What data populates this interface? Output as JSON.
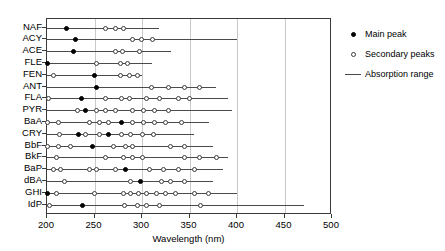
{
  "chart_data": {
    "type": "scatter",
    "title": "",
    "xlabel": "Wavelength (nm)",
    "ylabel": "",
    "xlim": [
      200,
      500
    ],
    "xticks": [
      200,
      250,
      300,
      350,
      400,
      450,
      500
    ],
    "xtick_labels": [
      "200",
      "250",
      "300",
      "350",
      "400",
      "450",
      "500"
    ],
    "grid": true,
    "grid_axis": "x",
    "legend_position": "right",
    "legend": [
      {
        "label": "Main peak",
        "marker": "filled-circle"
      },
      {
        "label": "Secondary peaks",
        "marker": "open-circle"
      },
      {
        "label": "Absorption range",
        "marker": "line"
      }
    ],
    "categories": [
      "NAF",
      "ACY",
      "ACE",
      "FLE",
      "FEN",
      "ANT",
      "FLA",
      "PYR",
      "BaA",
      "CRY",
      "BbF",
      "BkF",
      "BaP",
      "dBA",
      "GHI",
      "IdP"
    ],
    "rows": [
      {
        "category": "NAF",
        "range": [
          200,
          318
        ],
        "main": [
          221
        ],
        "secondary": [
          262,
          272,
          281
        ]
      },
      {
        "category": "ACY",
        "range": [
          200,
          400
        ],
        "main": [
          230
        ],
        "secondary": [
          290,
          299,
          311
        ]
      },
      {
        "category": "ACE",
        "range": [
          200,
          330
        ],
        "main": [
          228
        ],
        "secondary": [
          272,
          279,
          297
        ]
      },
      {
        "category": "FLE",
        "range": [
          200,
          310
        ],
        "main": [
          200
        ],
        "secondary": [
          252,
          277,
          285
        ]
      },
      {
        "category": "FEN",
        "range": [
          200,
          300
        ],
        "main": [
          250
        ],
        "secondary": [
          207,
          277,
          287,
          295
        ]
      },
      {
        "category": "ANT",
        "range": [
          200,
          378
        ],
        "main": [
          252
        ],
        "secondary": [
          310,
          328,
          345,
          360
        ]
      },
      {
        "category": "FLA",
        "range": [
          200,
          390
        ],
        "main": [
          236
        ],
        "secondary": [
          202,
          262,
          278,
          287,
          305,
          318,
          338,
          350
        ]
      },
      {
        "category": "PYR",
        "range": [
          200,
          395
        ],
        "main": [
          240
        ],
        "secondary": [
          232,
          252,
          262,
          272,
          290,
          302,
          313,
          328
        ]
      },
      {
        "category": "BaA",
        "range": [
          200,
          370
        ],
        "main": [
          278
        ],
        "secondary": [
          200,
          212,
          245,
          255,
          265,
          290,
          302,
          313,
          325,
          342
        ]
      },
      {
        "category": "CRY",
        "range": [
          200,
          355
        ],
        "main": [
          233,
          265
        ],
        "secondary": [
          213,
          240,
          255,
          278,
          288,
          300,
          312
        ]
      },
      {
        "category": "BbF",
        "range": [
          200,
          375
        ],
        "main": [
          248
        ],
        "secondary": [
          200,
          212,
          225,
          270,
          283,
          290,
          330,
          345
        ]
      },
      {
        "category": "BkF",
        "range": [
          200,
          390
        ],
        "main": [],
        "secondary": [
          210,
          262,
          280,
          290,
          300,
          345,
          360,
          378
        ]
      },
      {
        "category": "BaP",
        "range": [
          200,
          385
        ],
        "main": [
          283
        ],
        "secondary": [
          207,
          214,
          245,
          252,
          272,
          308,
          323,
          338,
          355
        ]
      },
      {
        "category": "dBA",
        "range": [
          200,
          375
        ],
        "main": [
          298
        ],
        "secondary": [
          218,
          288,
          320,
          330,
          345
        ]
      },
      {
        "category": "GHI",
        "range": [
          200,
          400
        ],
        "main": [
          200
        ],
        "secondary": [
          210,
          250,
          280,
          288,
          296,
          305,
          315,
          325,
          335,
          355,
          370
        ]
      },
      {
        "category": "IdP",
        "range": [
          200,
          470
        ],
        "main": [
          237
        ],
        "secondary": [
          203,
          282,
          295,
          305,
          318,
          362
        ]
      }
    ]
  }
}
